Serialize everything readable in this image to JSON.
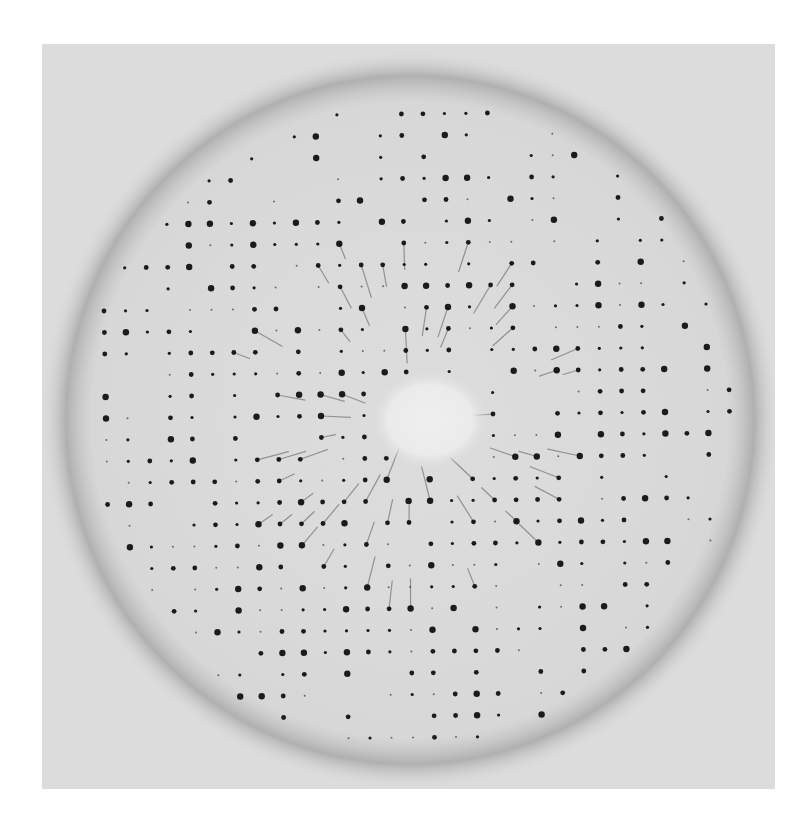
{
  "image": {
    "kind": "x-ray diffraction photograph",
    "background_color": "#ffffff",
    "film_color": "#dcdcdc",
    "spot_color": "#111111",
    "ring_color": "#a9a9a9",
    "center_hole_color": "#ebebeb",
    "frame": {
      "x": 42,
      "y": 44,
      "width": 733,
      "height": 745
    },
    "pattern_center": {
      "x": 410,
      "y": 420
    },
    "ring_radius": 335,
    "central_hole": {
      "x": 430,
      "y": 420,
      "rx": 55,
      "ry": 45
    },
    "lattice_spacing": 21.5,
    "spot_max_radius": 300
  }
}
